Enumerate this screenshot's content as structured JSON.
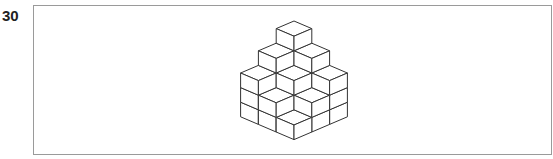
{
  "question": {
    "number": "30"
  },
  "figure": {
    "grid_size": [
      3,
      3
    ],
    "heights": [
      [
        5,
        4,
        3
      ],
      [
        4,
        3,
        2
      ],
      [
        3,
        2,
        1
      ]
    ],
    "line_color": "#333333",
    "face_color": "#ffffff"
  }
}
